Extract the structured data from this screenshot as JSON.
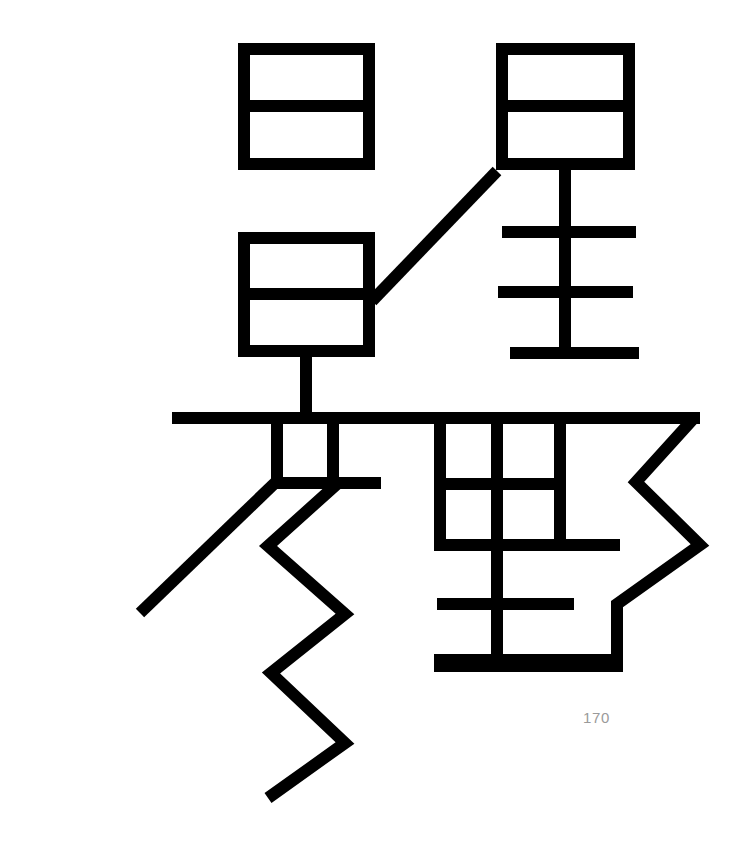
{
  "page": {
    "width": 745,
    "height": 850,
    "background_color": "#ffffff",
    "page_number": "170",
    "page_number_color": "#9a9a9a"
  },
  "figure": {
    "name": "cjk-character-glyph",
    "stroke_color": "#000000",
    "stroke_width": 12,
    "components": [
      {
        "name": "upper-left-box",
        "description": "Rectangle divided by one horizontal bar (ri/yue form)",
        "x": 238,
        "y": 43,
        "width": 137,
        "height": 127,
        "divider_y": 106
      },
      {
        "name": "middle-left-box",
        "description": "Rectangle divided by one horizontal bar with descender stem",
        "x": 238,
        "y": 232,
        "width": 137,
        "height": 125,
        "divider_y": 294,
        "stem_x": 306,
        "stem_bottom": 424
      },
      {
        "name": "upper-right-box",
        "description": "Rectangle divided by one horizontal bar (top of star radical)",
        "x": 496,
        "y": 43,
        "width": 139,
        "height": 127,
        "divider_y": 106
      },
      {
        "name": "right-vertical-stem",
        "description": "Vertical stroke below upper-right box",
        "x": 565,
        "y_top": 170,
        "y_bottom": 360
      },
      {
        "name": "right-crossbar-upper",
        "x1": 502,
        "x2": 635,
        "y": 232
      },
      {
        "name": "right-crossbar-middle",
        "x1": 498,
        "x2": 633,
        "y": 292
      },
      {
        "name": "right-crossbar-lower",
        "x1": 510,
        "x2": 638,
        "y": 353
      },
      {
        "name": "connecting-diagonal",
        "description": "Diagonal from middle-left box up to upper-right box",
        "x1": 377,
        "y1": 296,
        "x2": 497,
        "y2": 172
      },
      {
        "name": "long-horizontal-bar",
        "description": "Main horizontal stroke crossing the character",
        "x1": 172,
        "x2": 700,
        "y": 418
      },
      {
        "name": "small-center-box",
        "x": 272,
        "y": 424,
        "width": 66,
        "height": 59,
        "right_extension_x": 381
      },
      {
        "name": "long-left-diagonal",
        "x1": 273,
        "y1": 483,
        "x2": 140,
        "y2": 612
      },
      {
        "name": "zigzag-stroke",
        "description": "Lightning-bolt zigzag descending stroke",
        "points": [
          [
            337,
            484
          ],
          [
            268,
            546
          ],
          [
            345,
            614
          ],
          [
            271,
            673
          ],
          [
            345,
            743
          ],
          [
            268,
            798
          ]
        ]
      },
      {
        "name": "right-grid-box",
        "description": "Two-by-two grid (tian-like) under main bar",
        "x": 434,
        "y": 424,
        "width": 132,
        "height": 121,
        "divider_x": 497,
        "divider_y": 484
      },
      {
        "name": "right-hook-zigzag",
        "description": "Outer hooked contour on right side",
        "points": [
          [
            566,
            424
          ],
          [
            700,
            424
          ],
          [
            640,
            484
          ],
          [
            700,
            545
          ],
          [
            620,
            605
          ],
          [
            620,
            666
          ],
          [
            434,
            666
          ]
        ]
      },
      {
        "name": "lower-center-stem",
        "x": 497,
        "y_top": 484,
        "y_bottom": 666
      },
      {
        "name": "lower-crossbar",
        "x1": 437,
        "x2": 573,
        "y": 605
      },
      {
        "name": "bottom-horizontal",
        "x1": 434,
        "x2": 628,
        "y": 660
      }
    ]
  }
}
